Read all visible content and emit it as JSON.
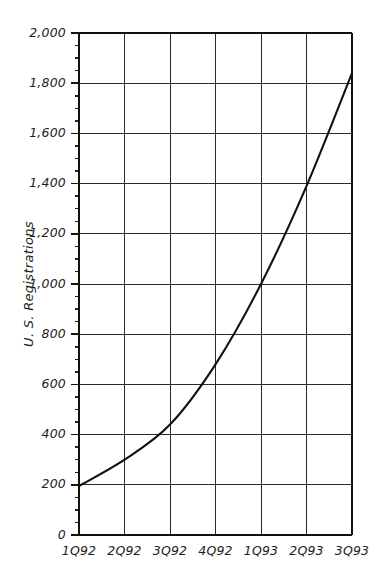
{
  "chart_data": {
    "type": "line",
    "title": "",
    "subtitle": "",
    "xlabel": "",
    "ylabel": "U. S. Registrations",
    "categories": [
      "1Q92",
      "2Q92",
      "3Q92",
      "4Q92",
      "1Q93",
      "2Q93",
      "3Q93"
    ],
    "values": [
      195,
      300,
      440,
      680,
      1000,
      1390,
      1840
    ],
    "series": [
      {
        "name": "U. S. Registrations",
        "values": [
          195,
          300,
          440,
          680,
          1000,
          1390,
          1840
        ]
      }
    ],
    "ylim": [
      0,
      2000
    ],
    "ytick_values": [
      0,
      200,
      400,
      600,
      800,
      1000,
      1200,
      1400,
      1600,
      1800,
      2000
    ],
    "ytick_labels": [
      "0",
      "200",
      "400",
      "600",
      "800",
      "1,000",
      "1,200",
      "1,400",
      "1,600",
      "1,800",
      "2,000"
    ],
    "y_minor_tick_interval": 50,
    "xtick_labels": [
      "1Q92",
      "2Q92",
      "3Q92",
      "4Q92",
      "1Q93",
      "2Q93",
      "3Q93"
    ],
    "grid": true,
    "grid_horizontal": true,
    "grid_vertical": true,
    "legend": false,
    "legend_position": "none",
    "line_color": "#111111",
    "grid_color": "#2a2a2a",
    "background_color": "#ffffff",
    "annotations": []
  },
  "figure": {
    "background_color": "#ffffff",
    "axis_color": "#111111"
  }
}
